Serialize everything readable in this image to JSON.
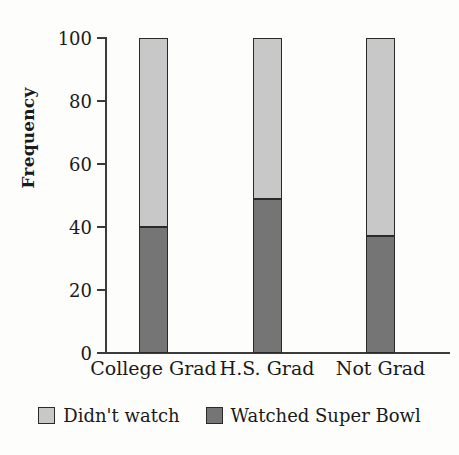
{
  "chart_data": {
    "type": "bar",
    "subtype": "stacked-bar",
    "title": "",
    "xlabel": "",
    "ylabel": "Frequency",
    "ylim": [
      0,
      100
    ],
    "yticks": [
      0,
      20,
      40,
      60,
      80,
      100
    ],
    "grid": false,
    "legend_position": "bottom",
    "categories": [
      "College Grad",
      "H.S. Grad",
      "Not Grad"
    ],
    "series": [
      {
        "name": "Watched Super Bowl",
        "color": "#757575",
        "values": [
          40,
          49,
          37
        ]
      },
      {
        "name": "Didn't watch",
        "color": "#c8c8c8",
        "values": [
          60,
          51,
          63
        ]
      }
    ],
    "stack_order_bottom_to_top": [
      "Watched Super Bowl",
      "Didn't watch"
    ]
  },
  "axes": {
    "y_title": "Frequency",
    "y_tick_labels": [
      "100",
      "80",
      "60",
      "40",
      "20",
      "0"
    ],
    "x_tick_labels": [
      "College Grad",
      "H.S. Grad",
      "Not Grad"
    ]
  },
  "legend": {
    "entries": [
      {
        "label": "Didn't watch",
        "color": "#c8c8c8",
        "swatch": "light-gray-swatch-icon"
      },
      {
        "label": "Watched Super Bowl",
        "color": "#757575",
        "swatch": "dark-gray-swatch-icon"
      }
    ]
  },
  "colors": {
    "light_gray": "#c8c8c8",
    "dark_gray": "#757575",
    "axis": "#3b3b3b",
    "outline": "#2a2a2a",
    "background": "#fdfdfb",
    "text": "#1a1a1a"
  }
}
